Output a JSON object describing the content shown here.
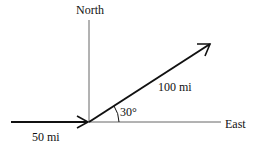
{
  "labels": {
    "north": "North",
    "east": "East",
    "vector_a": "50 mi",
    "vector_b": "100 mi",
    "angle": "30°"
  },
  "colors": {
    "stroke": "#111111",
    "axis": "#555555"
  }
}
